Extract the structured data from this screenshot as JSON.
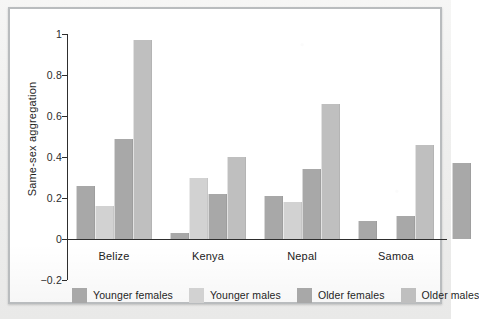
{
  "chart_data": {
    "type": "bar",
    "title": "",
    "subtitle": "",
    "xlabel": "",
    "ylabel": "Same-sex aggregation",
    "categories": [
      "Belize",
      "Kenya",
      "Nepal",
      "Samoa"
    ],
    "series": [
      {
        "name": "Younger females",
        "color": "#a8a8a8",
        "values": [
          0.26,
          0.03,
          0.21,
          0.09
        ]
      },
      {
        "name": "Younger males",
        "color": "#d2d2d2",
        "values": [
          0.16,
          0.3,
          0.18,
          0.0
        ]
      },
      {
        "name": "Older females",
        "color": "#a8a8a8",
        "values": [
          0.49,
          0.22,
          0.34,
          0.11
        ]
      },
      {
        "name": "Older males",
        "color": "#bfbfbf",
        "values": [
          0.97,
          0.4,
          0.66,
          0.46
        ]
      }
    ],
    "ylim": [
      -0.2,
      1
    ],
    "yticks": [
      1,
      0.8,
      0.6,
      0.4,
      0.2,
      0,
      -0.2
    ],
    "ytick_labels": [
      "1",
      "0.8",
      "0.6",
      "0.4",
      "0.2",
      "0",
      "−0.2"
    ],
    "grid": false,
    "legend_position": "bottom",
    "clipped_group": {
      "note": "partial fifth group cut off at right edge of figure",
      "values": [
        0.37
      ]
    }
  },
  "legend": {
    "items": [
      {
        "label": "Younger females",
        "color": "#a8a8a8"
      },
      {
        "label": "Younger males",
        "color": "#d2d2d2"
      },
      {
        "label": "Older females",
        "color": "#a8a8a8"
      },
      {
        "label": "Older males",
        "color": "#bfbfbf"
      }
    ]
  },
  "colors": {
    "axis": "#2e2e2e",
    "text": "#1f1f1f",
    "frame": "#b9bcbe",
    "plot_background": "#ffffff",
    "page_background": "#f2f2f1"
  }
}
